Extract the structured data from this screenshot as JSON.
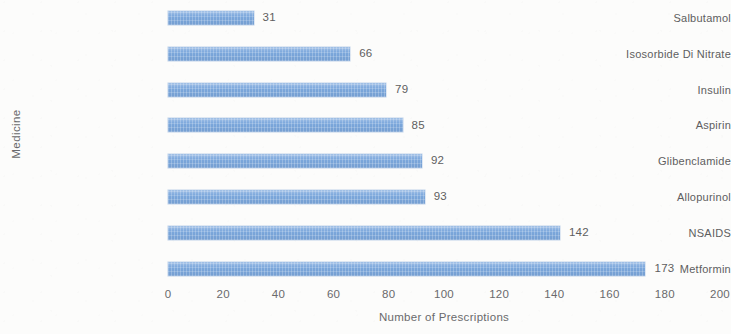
{
  "chart_data": {
    "type": "bar",
    "orientation": "horizontal",
    "title": "",
    "xlabel": "Number of Prescriptions",
    "ylabel": "Medicine",
    "categories": [
      "Salbutamol",
      "Isosorbide Di Nitrate",
      "Insulin",
      "Aspirin",
      "Glibenclamide",
      "Allopurinol",
      "NSAIDS",
      "Metformin"
    ],
    "values": [
      31,
      66,
      79,
      85,
      92,
      93,
      142,
      173
    ],
    "data_labels": [
      "31",
      "66",
      "79",
      "85",
      "92",
      "93",
      "142",
      "173"
    ],
    "xlim": [
      0,
      200
    ],
    "xticks": [
      0,
      20,
      40,
      60,
      80,
      100,
      120,
      140,
      160,
      180,
      200
    ],
    "xtick_labels": [
      "0",
      "20",
      "40",
      "60",
      "80",
      "100",
      "120",
      "140",
      "160",
      "180",
      "200"
    ],
    "grid": false,
    "legend": false,
    "bar_color": "#7ba7dc",
    "text_color": "#5e5e60",
    "background_color": "#fcfcfb"
  }
}
